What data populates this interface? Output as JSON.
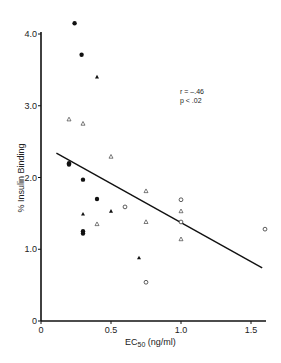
{
  "chart_data": {
    "type": "scatter",
    "title": "",
    "xlabel": "EC50 (ng/ml)",
    "xlabel_main": "EC",
    "xlabel_sub": "50",
    "xlabel_unit": " (ng/ml)",
    "ylabel": "% Insulin Binding",
    "xlim": [
      0,
      1.6
    ],
    "ylim": [
      0,
      4.0
    ],
    "x_ticks": [
      0,
      0.5,
      1.0,
      1.5
    ],
    "x_tick_labels": [
      "0",
      "0.5",
      "1.0",
      "1.5"
    ],
    "y_ticks": [
      0,
      1.0,
      2.0,
      3.0,
      4.0
    ],
    "y_tick_labels": [
      "0",
      "1.0",
      "2.0",
      "3.0",
      "4.0"
    ],
    "grid": false,
    "legend": null,
    "annotations": [
      "r = –.46",
      "p < .02"
    ],
    "series": [
      {
        "name": "filled-circle",
        "marker": "filled-circle",
        "points": [
          [
            0.24,
            4.15
          ],
          [
            0.29,
            3.71
          ],
          [
            0.2,
            2.2
          ],
          [
            0.2,
            2.18
          ],
          [
            0.3,
            1.97
          ],
          [
            0.4,
            1.7
          ],
          [
            0.3,
            1.25
          ],
          [
            0.3,
            1.22
          ]
        ]
      },
      {
        "name": "filled-triangle",
        "marker": "filled-triangle",
        "points": [
          [
            0.4,
            3.4
          ],
          [
            0.3,
            1.49
          ],
          [
            0.5,
            1.53
          ],
          [
            0.7,
            0.88
          ]
        ]
      },
      {
        "name": "open-triangle",
        "marker": "open-triangle",
        "points": [
          [
            0.2,
            2.81
          ],
          [
            0.3,
            2.75
          ],
          [
            0.5,
            2.29
          ],
          [
            0.4,
            1.35
          ],
          [
            0.75,
            1.81
          ],
          [
            0.75,
            1.38
          ],
          [
            1.0,
            1.53
          ],
          [
            1.0,
            1.14
          ]
        ]
      },
      {
        "name": "open-circle",
        "marker": "open-circle",
        "points": [
          [
            0.6,
            1.59
          ],
          [
            0.75,
            0.54
          ],
          [
            1.0,
            1.69
          ],
          [
            1.0,
            1.38
          ],
          [
            1.6,
            1.28
          ]
        ]
      }
    ],
    "regression_line": {
      "x": [
        0.11,
        1.58
      ],
      "y": [
        2.34,
        0.74
      ],
      "r": -0.46,
      "p": "< .02"
    }
  }
}
